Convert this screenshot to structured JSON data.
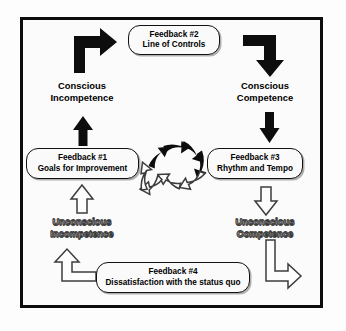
{
  "diagram": {
    "colors": {
      "line": "#0d0d0d",
      "hollow_stroke": "#3c3c3c",
      "background": "#fdfdfd",
      "box_fill": "#fafafa"
    }
  },
  "feedback_boxes": [
    {
      "id": "feedback-2",
      "title": "Feedback #2",
      "subtitle": "Line of Controls",
      "position": "top"
    },
    {
      "id": "feedback-1",
      "title": "Feedback #1",
      "subtitle": "Goals for Improvement",
      "position": "left"
    },
    {
      "id": "feedback-3",
      "title": "Feedback #3",
      "subtitle": "Rhythm and Tempo",
      "position": "right"
    },
    {
      "id": "feedback-4",
      "title": "Feedback #4",
      "subtitle": "Dissatisfaction with the status quo",
      "position": "bottom"
    }
  ],
  "stages": [
    {
      "id": "conscious-incompetence",
      "line1": "Conscious",
      "line2": "Incompetence",
      "style": "solid",
      "position": "upper-left"
    },
    {
      "id": "conscious-competence",
      "line1": "Conscious",
      "line2": "Competence",
      "style": "solid",
      "position": "upper-right"
    },
    {
      "id": "unconscious-incompetence",
      "line1": "Unconscious",
      "line2": "Incompetence",
      "style": "hollow",
      "position": "lower-left"
    },
    {
      "id": "unconscious-competence",
      "line1": "Unconscious",
      "line2": "Competence",
      "style": "hollow",
      "position": "lower-right"
    }
  ],
  "connectors": [
    {
      "id": "elbow-up-right",
      "style": "solid",
      "icon": "elbow-arrow-up-right-icon"
    },
    {
      "id": "elbow-right-down",
      "style": "solid",
      "icon": "elbow-arrow-right-down-icon"
    },
    {
      "id": "arrow-up-left",
      "style": "solid",
      "icon": "arrow-up-icon"
    },
    {
      "id": "arrow-down-right",
      "style": "solid",
      "icon": "arrow-down-icon"
    },
    {
      "id": "hollow-arrow-up-left",
      "style": "hollow",
      "icon": "arrow-up-outline-icon"
    },
    {
      "id": "hollow-arrow-down-right",
      "style": "hollow",
      "icon": "arrow-down-outline-icon"
    },
    {
      "id": "hollow-elbow-left-up",
      "style": "hollow",
      "icon": "elbow-arrow-left-up-outline-icon"
    },
    {
      "id": "hollow-elbow-down-left",
      "style": "hollow",
      "icon": "elbow-arrow-down-left-outline-icon"
    }
  ],
  "center_ring": {
    "description": "Clockwise ring of eight curved chevron arrows",
    "solid_segment_count": 4,
    "hollow_segment_count": 4,
    "direction": "clockwise"
  }
}
